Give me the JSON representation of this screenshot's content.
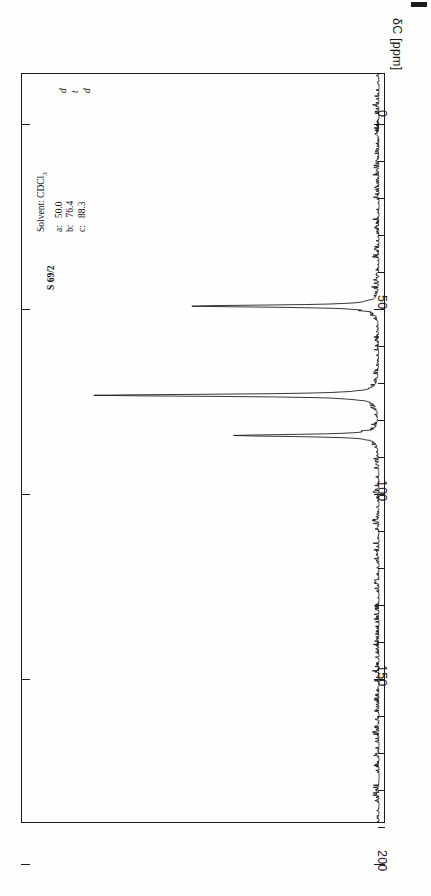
{
  "document": {
    "kind": "13C NMR spectrum chart",
    "sample_id": "S 69/2",
    "corner_mark": "register-mark"
  },
  "annotations": {
    "solvent_label": "Solvent: CDCl",
    "solvent_subscript": "3",
    "assignments": [
      {
        "key": "a:",
        "shift": "50.0",
        "multiplicity": "d"
      },
      {
        "key": "b:",
        "shift": "76.4",
        "multiplicity": "t"
      },
      {
        "key": "c:",
        "shift": "88.3",
        "multiplicity": "d"
      }
    ]
  },
  "axis": {
    "title": "δC [ppm]",
    "unit": "ppm",
    "orientation": "vertical-right",
    "direction": "0 at top to 200 at bottom",
    "major_ticks": [
      "0",
      "50",
      "100",
      "150",
      "200"
    ],
    "minor_tick_step": 10
  },
  "chart_data": {
    "type": "line",
    "title": "S 69/2",
    "xlabel": "δC [ppm]",
    "ylabel": "Intensity",
    "xlim": [
      0,
      200
    ],
    "grid": false,
    "legend": null,
    "orientation": "rotated-90",
    "baseline_noise": true,
    "peaks": [
      {
        "label": "a",
        "shift_ppm": 50.0,
        "multiplicity": "d",
        "relative_intensity": 0.66
      },
      {
        "label": "b",
        "shift_ppm": 76.4,
        "multiplicity": "t",
        "relative_intensity": 1.0,
        "note": "CDCl3 solvent"
      },
      {
        "label": "c",
        "shift_ppm": 88.3,
        "multiplicity": "d",
        "relative_intensity": 0.51
      }
    ],
    "x": [
      0,
      50,
      76.4,
      88.3,
      200
    ],
    "values": [
      0.02,
      0.66,
      1.0,
      0.51,
      0.02
    ]
  },
  "ticks": [
    {
      "value": "0",
      "pos": 124,
      "type": "major"
    },
    {
      "value": "",
      "pos": 161,
      "type": "minor"
    },
    {
      "value": "",
      "pos": 198,
      "type": "minor"
    },
    {
      "value": "",
      "pos": 235,
      "type": "minor"
    },
    {
      "value": "",
      "pos": 272,
      "type": "minor"
    },
    {
      "value": "50",
      "pos": 309,
      "type": "major"
    },
    {
      "value": "",
      "pos": 346,
      "type": "minor"
    },
    {
      "value": "",
      "pos": 383,
      "type": "minor"
    },
    {
      "value": "",
      "pos": 420,
      "type": "minor"
    },
    {
      "value": "",
      "pos": 457,
      "type": "minor"
    },
    {
      "value": "100",
      "pos": 494,
      "type": "major"
    },
    {
      "value": "",
      "pos": 531,
      "type": "minor"
    },
    {
      "value": "",
      "pos": 568,
      "type": "minor"
    },
    {
      "value": "",
      "pos": 605,
      "type": "minor"
    },
    {
      "value": "",
      "pos": 642,
      "type": "minor"
    },
    {
      "value": "150",
      "pos": 679,
      "type": "major"
    },
    {
      "value": "",
      "pos": 716,
      "type": "minor"
    },
    {
      "value": "",
      "pos": 753,
      "type": "minor"
    },
    {
      "value": "",
      "pos": 790,
      "type": "minor"
    },
    {
      "value": "",
      "pos": 827,
      "type": "minor"
    },
    {
      "value": "200",
      "pos": 864,
      "type": "major"
    }
  ],
  "multiplicity_marks": [
    {
      "text": "d",
      "top": 93,
      "left": 58
    },
    {
      "text": "t",
      "top": 93,
      "left": 70
    },
    {
      "text": "d",
      "top": 93,
      "left": 82
    }
  ]
}
